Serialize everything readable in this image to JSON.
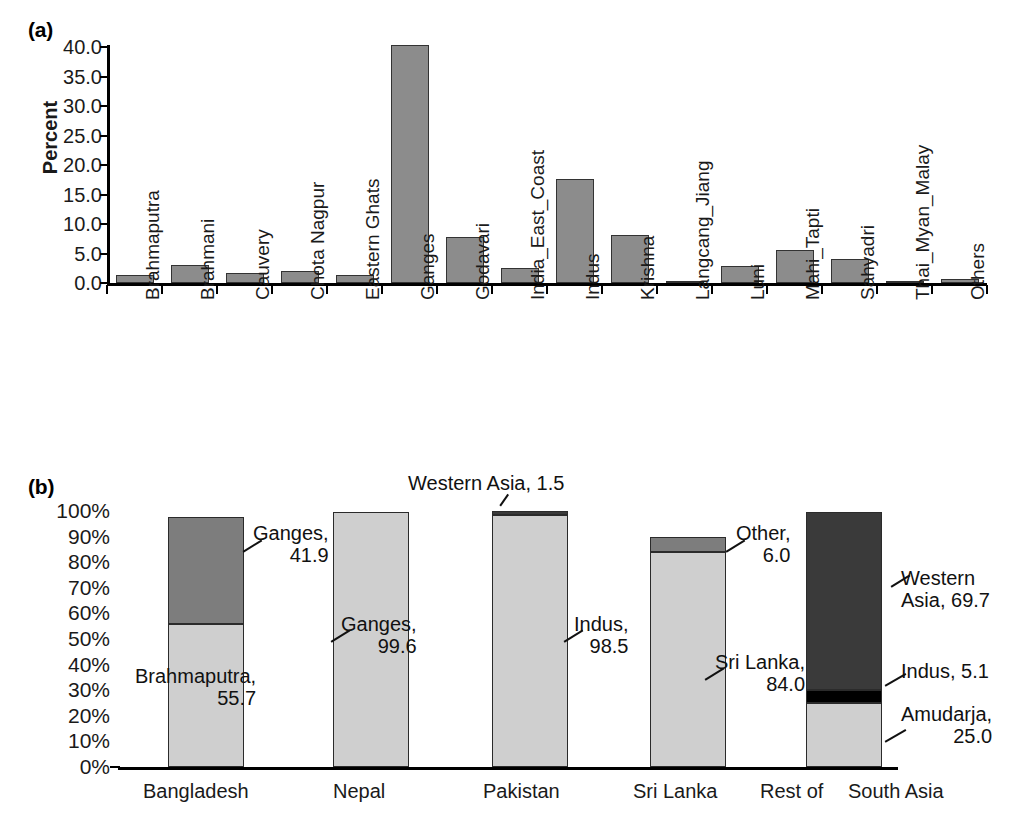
{
  "figure": {
    "panel_a_tag": "(a)",
    "panel_b_tag": "(b)"
  },
  "chart_data": [
    {
      "type": "bar",
      "panel": "(a)",
      "title": "",
      "xlabel": "",
      "ylabel": "Percent",
      "ylim": [
        0,
        40
      ],
      "ytick_labels": [
        "40.0",
        "35.0",
        "30.0",
        "25.0",
        "20.0",
        "15.0",
        "10.0",
        "5.0",
        "0.0"
      ],
      "ytick_values": [
        40.0,
        35.0,
        30.0,
        25.0,
        20.0,
        15.0,
        10.0,
        5.0,
        0.0
      ],
      "grid": false,
      "legend": "none",
      "categories": [
        "Brahmaputra",
        "Brahmani",
        "Cauvery",
        "Chota Nagpur",
        "Eastern Ghats",
        "Ganges",
        "Godavari",
        "India_East_Coast",
        "Indus",
        "Krishna",
        "Langcang_Jiang",
        "Luni",
        "Mahi_Tapti",
        "Sahyadri",
        "Thai_Myan_Malay",
        "Others"
      ],
      "values": [
        1.4,
        3.0,
        1.7,
        2.0,
        1.4,
        40.3,
        7.8,
        2.5,
        17.6,
        8.1,
        0.1,
        2.8,
        5.6,
        4.0,
        0.1,
        0.7
      ],
      "bar_color": "#8c8c8c",
      "bar_edge_color": "#333333"
    },
    {
      "type": "bar",
      "panel": "(b)",
      "subtype": "stacked-100",
      "title": "",
      "xlabel": "",
      "ylabel": "",
      "ylim": [
        0,
        100
      ],
      "ytick_labels": [
        "100%",
        "90%",
        "80%",
        "70%",
        "60%",
        "50%",
        "40%",
        "30%",
        "20%",
        "10%",
        "0%"
      ],
      "ytick_values": [
        100,
        90,
        80,
        70,
        60,
        50,
        40,
        30,
        20,
        10,
        0
      ],
      "grid": false,
      "legend": "none",
      "categories": [
        "Bangladesh",
        "Nepal",
        "Pakistan",
        "Sri Lanka",
        "Rest of South Asia"
      ],
      "category_display": [
        "Bangladesh",
        "Nepal",
        "Pakistan",
        "Sri Lanka",
        "Rest of",
        "South Asia"
      ],
      "columns": [
        {
          "name": "Bangladesh",
          "segments": [
            {
              "label": "Brahmaputra",
              "value": 55.7,
              "shade": "light"
            },
            {
              "label": "Ganges",
              "value": 41.9,
              "shade": "mid"
            }
          ]
        },
        {
          "name": "Nepal",
          "segments": [
            {
              "label": "Ganges",
              "value": 99.6,
              "shade": "light"
            }
          ]
        },
        {
          "name": "Pakistan",
          "segments": [
            {
              "label": "Indus",
              "value": 98.5,
              "shade": "light"
            },
            {
              "label": "Western Asia",
              "value": 1.5,
              "shade": "dark"
            }
          ]
        },
        {
          "name": "Sri Lanka",
          "segments": [
            {
              "label": "Sri Lanka",
              "value": 84.0,
              "shade": "light"
            },
            {
              "label": "Other",
              "value": 6.0,
              "shade": "mid"
            }
          ]
        },
        {
          "name": "Rest of South Asia",
          "segments": [
            {
              "label": "Amudarja",
              "value": 25.0,
              "shade": "light"
            },
            {
              "label": "Indus",
              "value": 5.1,
              "shade": "black"
            },
            {
              "label": "Western Asia",
              "value": 69.7,
              "shade": "dark"
            }
          ]
        }
      ],
      "annotations": [
        {
          "id": "ganges-bangladesh",
          "line1": "Ganges,",
          "line2": "41.9"
        },
        {
          "id": "brahmaputra-bangladesh",
          "line1": "Brahmaputra,",
          "line2": "55.7"
        },
        {
          "id": "ganges-nepal",
          "line1": "Ganges,",
          "line2": "99.6"
        },
        {
          "id": "western-asia-pakistan",
          "line1": "Western Asia, 1.5",
          "line2": ""
        },
        {
          "id": "indus-pakistan",
          "line1": "Indus,",
          "line2": "98.5"
        },
        {
          "id": "other-srilanka",
          "line1": "Other,",
          "line2": "6.0"
        },
        {
          "id": "srilanka-srilanka",
          "line1": "Sri Lanka,",
          "line2": "84.0"
        },
        {
          "id": "western-asia-rest",
          "line1": "Western",
          "line2": "Asia, 69.7"
        },
        {
          "id": "indus-rest",
          "line1": "Indus, 5.1",
          "line2": ""
        },
        {
          "id": "amudarja-rest",
          "line1": "Amudarja,",
          "line2": "25.0"
        }
      ],
      "colors": {
        "light": "#cfcfcf",
        "mid": "#7d7d7d",
        "dark": "#3a3a3a",
        "black": "#000000",
        "edge": "#2b2b2b"
      }
    }
  ]
}
